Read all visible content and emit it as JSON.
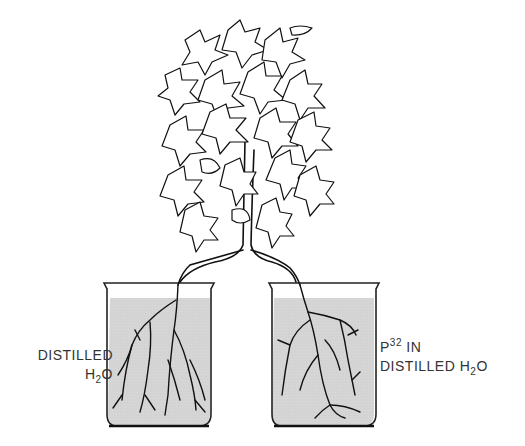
{
  "diagram": {
    "title": "",
    "left_beaker": {
      "line1": "DISTILLED",
      "line2_main": "H",
      "line2_sub": "2",
      "line2_end": "O"
    },
    "right_beaker": {
      "line1_main": "P",
      "line1_sup": "32",
      "line1_end": " IN",
      "line2_main": "DISTILLED H",
      "line2_sub": "2",
      "line2_end": "O"
    },
    "colors": {
      "water": "#d4d4d4",
      "outline": "#222222",
      "text": "#333333"
    }
  }
}
